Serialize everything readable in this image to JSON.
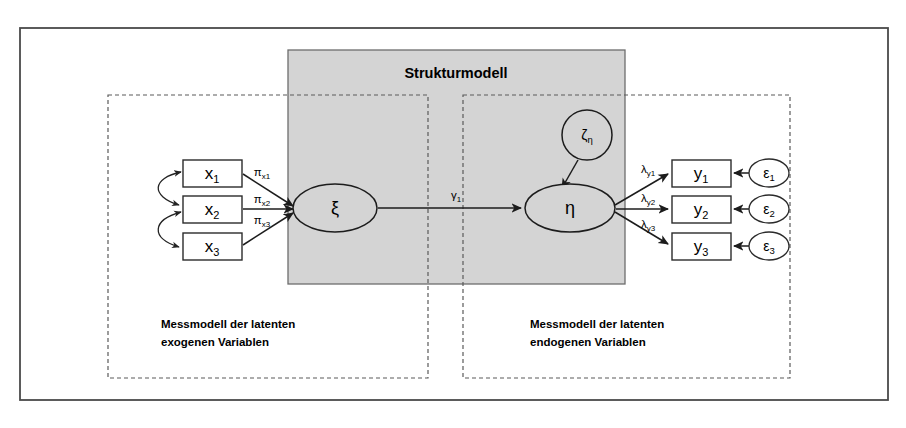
{
  "diagram": {
    "type": "structural-equation-model",
    "title": "Strukturmodell",
    "colors": {
      "panel_fill": "#d4d4d4",
      "panel_stroke": "#6d6d6d",
      "frame_stroke": "#4a4a4a",
      "node_stroke": "#1c1c1c",
      "background": "#ffffff"
    },
    "structural_panel": {
      "label": "Strukturmodell"
    },
    "measurement_panels": [
      {
        "id": "exogenous",
        "caption_line1": "Messmodell der latenten",
        "caption_line2": "exogenen Variablen"
      },
      {
        "id": "endogenous",
        "caption_line1": "Messmodell der latenten",
        "caption_line2": "endogenen Variablen"
      }
    ],
    "indicators_exogenous": [
      {
        "base": "x",
        "sub": "1"
      },
      {
        "base": "x",
        "sub": "2"
      },
      {
        "base": "x",
        "sub": "3"
      }
    ],
    "indicators_endogenous": [
      {
        "base": "y",
        "sub": "1"
      },
      {
        "base": "y",
        "sub": "2"
      },
      {
        "base": "y",
        "sub": "3"
      }
    ],
    "errors_endogenous": [
      {
        "base": "ε",
        "sub": "1"
      },
      {
        "base": "ε",
        "sub": "2"
      },
      {
        "base": "ε",
        "sub": "3"
      }
    ],
    "latent_exogenous": {
      "label": "ξ"
    },
    "latent_endogenous": {
      "label": "η"
    },
    "disturbance": {
      "base": "ζ",
      "sub": "η"
    },
    "loadings_exogenous": [
      {
        "base": "π",
        "sub": "x1"
      },
      {
        "base": "π",
        "sub": "x2"
      },
      {
        "base": "π",
        "sub": "x3"
      }
    ],
    "loadings_endogenous": [
      {
        "base": "λ",
        "sub": "y1"
      },
      {
        "base": "λ",
        "sub": "y2"
      },
      {
        "base": "λ",
        "sub": "y3"
      }
    ],
    "structural_path": {
      "base": "γ",
      "sub": "1"
    }
  }
}
